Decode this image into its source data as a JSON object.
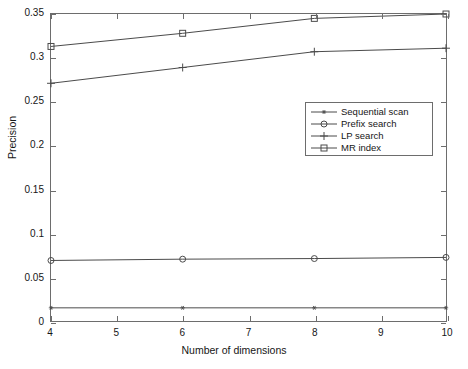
{
  "chart_data": {
    "type": "line",
    "title": "",
    "xlabel": "Number of dimensions",
    "ylabel": "Precision",
    "x": [
      4,
      6,
      8,
      10
    ],
    "xlim": [
      4,
      10
    ],
    "ylim": [
      0,
      0.35
    ],
    "xticks": [
      "4",
      "5",
      "6",
      "7",
      "8",
      "9",
      "10"
    ],
    "xtick_values": [
      4,
      5,
      6,
      7,
      8,
      9,
      10
    ],
    "yticks": [
      "0",
      "0.05",
      "0.1",
      "0.15",
      "0.2",
      "0.25",
      "0.3",
      "0.35"
    ],
    "ytick_values": [
      0,
      0.05,
      0.1,
      0.15,
      0.2,
      0.25,
      0.3,
      0.35
    ],
    "grid": false,
    "legend_position": "center-right",
    "series": [
      {
        "name": "Sequential scan",
        "marker": "star",
        "color": "#4a4a4a",
        "values": [
          0.015,
          0.015,
          0.015,
          0.015
        ]
      },
      {
        "name": "Prefix search",
        "marker": "circle",
        "color": "#4a4a4a",
        "values": [
          0.069,
          0.0705,
          0.0712,
          0.0725
        ]
      },
      {
        "name": "LP search",
        "marker": "plus",
        "color": "#4a4a4a",
        "values": [
          0.271,
          0.289,
          0.307,
          0.311
        ]
      },
      {
        "name": "MR index",
        "marker": "square",
        "color": "#4a4a4a",
        "values": [
          0.313,
          0.328,
          0.345,
          0.35
        ]
      }
    ]
  },
  "legend": {
    "entries": [
      {
        "label": "Sequential scan",
        "marker": "star"
      },
      {
        "label": "Prefix search",
        "marker": "circle"
      },
      {
        "label": "LP search",
        "marker": "plus"
      },
      {
        "label": "MR index",
        "marker": "square"
      }
    ]
  },
  "colors": {
    "axis": "#6d6d6d",
    "line": "#4a4a4a",
    "text": "#161616",
    "background": "#ffffff"
  }
}
